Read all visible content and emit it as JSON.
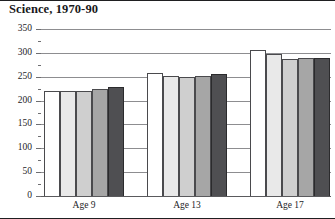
{
  "chart_data": {
    "type": "bar",
    "title": "Science, 1970-90",
    "xlabel": "",
    "ylabel": "",
    "ylim": [
      0,
      350
    ],
    "ytick_values": [
      0,
      50,
      100,
      150,
      200,
      250,
      300,
      350
    ],
    "ytick_labels": [
      "0",
      "50",
      "100",
      "150",
      "200",
      "250",
      "300",
      "350"
    ],
    "grid": true,
    "legend": "none",
    "categories": [
      "Age 9",
      "Age 13",
      "Age 17"
    ],
    "series": [
      {
        "name": "1970",
        "shade": "#ffffff",
        "values": [
          220,
          258,
          306
        ]
      },
      {
        "name": "1975",
        "shade": "#e9e9e9",
        "values": [
          220,
          251,
          298
        ]
      },
      {
        "name": "1980",
        "shade": "#cfcfcf",
        "values": [
          220,
          250,
          288
        ]
      },
      {
        "name": "1985",
        "shade": "#a6a6a6",
        "values": [
          224,
          251,
          289
        ]
      },
      {
        "name": "1990",
        "shade": "#4f4f52",
        "values": [
          229,
          256,
          290
        ]
      }
    ]
  }
}
